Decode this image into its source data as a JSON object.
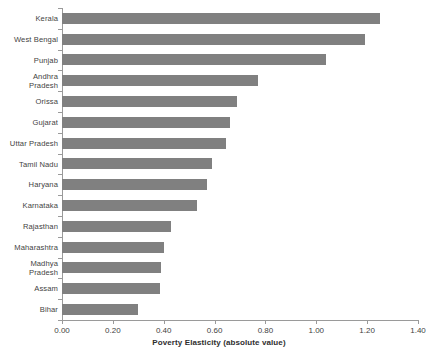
{
  "chart_data": {
    "type": "bar",
    "orientation": "horizontal",
    "title": "",
    "xlabel": "Poverty Elasticity (absolute value)",
    "ylabel": "",
    "xlim": [
      0.0,
      1.4
    ],
    "xticks": [
      "0.00",
      "0.20",
      "0.40",
      "0.60",
      "0.80",
      "1.00",
      "1.20",
      "1.40"
    ],
    "xtick_values": [
      0.0,
      0.2,
      0.4,
      0.6,
      0.8,
      1.0,
      1.2,
      1.4
    ],
    "grid": false,
    "legend": false,
    "bar_color": "#808080",
    "axis_color": "#9a9a9a",
    "categories": [
      "Kerala",
      "West Bengal",
      "Punjab",
      "Andhra\nPradesh",
      "Orissa",
      "Gujarat",
      "Uttar Pradesh",
      "Tamil Nadu",
      "Haryana",
      "Karnataka",
      "Rajasthan",
      "Maharashtra",
      "Madhya\nPradesh",
      "Assam",
      "Bihar"
    ],
    "values": [
      1.25,
      1.19,
      1.04,
      0.77,
      0.69,
      0.66,
      0.645,
      0.59,
      0.57,
      0.53,
      0.43,
      0.4,
      0.39,
      0.385,
      0.3
    ]
  }
}
